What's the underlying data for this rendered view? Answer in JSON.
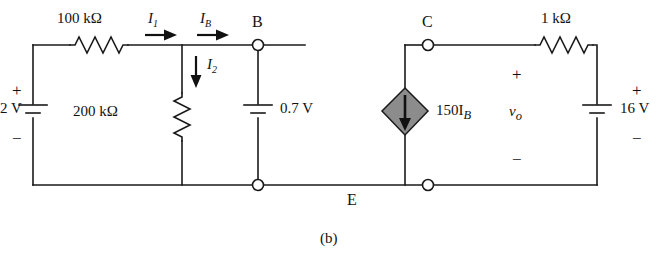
{
  "figure": {
    "caption": "(b)",
    "type": "circuit-schematic"
  },
  "sources": {
    "v_in": {
      "label": "2 V",
      "plus": "+",
      "minus": "−"
    },
    "v_be": {
      "label": "0.7 V"
    },
    "v_cc": {
      "label": "16 V",
      "plus": "+",
      "minus": "−"
    },
    "dependent_current": {
      "label": "150I",
      "subscript": "B"
    }
  },
  "resistors": {
    "r_base": "100 kΩ",
    "r_shunt": "200 kΩ",
    "r_collector": "1 kΩ"
  },
  "currents": {
    "i1": {
      "symbol": "I",
      "subscript": "1"
    },
    "ib": {
      "symbol": "I",
      "subscript": "B"
    },
    "i2": {
      "symbol": "I",
      "subscript": "2"
    }
  },
  "nodes": {
    "b": "B",
    "c": "C",
    "e": "E"
  },
  "output": {
    "symbol": "v",
    "subscript": "o",
    "plus": "+",
    "minus": "−"
  },
  "colors": {
    "wire": "#1a1a1a",
    "source_fill": "#8c8c8c",
    "background": "#ffffff"
  }
}
